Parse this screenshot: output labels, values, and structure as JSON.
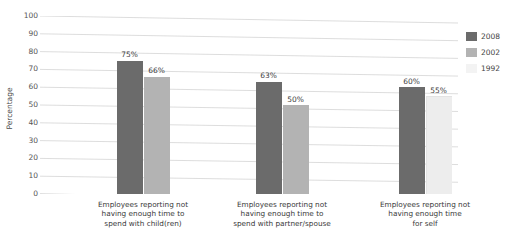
{
  "chart_data": {
    "type": "bar",
    "title": "",
    "xlabel": "",
    "ylabel": "Percentage",
    "ylim": [
      0,
      100
    ],
    "ytick_step": 10,
    "grid": true,
    "legend_position": "right",
    "categories": [
      "Employees reporting not having enough time to spend with child(ren)",
      "Employees reporting not having enough time to spend with partner/spouse",
      "Employees reporting not having enough time for self"
    ],
    "category_lines": [
      [
        "Employees reporting not",
        "having enough time to",
        "spend with child(ren)"
      ],
      [
        "Employees reporting not",
        "having enough time to",
        "spend with partner/spouse"
      ],
      [
        "Employees reporting not",
        "having enough time",
        "for self"
      ]
    ],
    "series": [
      {
        "name": "2008",
        "color": "#6b6b6b",
        "values": [
          75,
          63,
          60
        ]
      },
      {
        "name": "2002",
        "color": "#b3b3b3",
        "values": [
          66,
          50,
          null
        ]
      },
      {
        "name": "1992",
        "color": "#ededed",
        "values": [
          null,
          null,
          55
        ]
      }
    ],
    "yticks": [
      "100",
      "90",
      "80",
      "70",
      "60",
      "50",
      "40",
      "30",
      "20",
      "10",
      "0"
    ],
    "data_labels": [
      {
        "text": "75%",
        "group": 0,
        "series": "2008"
      },
      {
        "text": "66%",
        "group": 0,
        "series": "2002"
      },
      {
        "text": "63%",
        "group": 1,
        "series": "2008"
      },
      {
        "text": "50%",
        "group": 1,
        "series": "2002"
      },
      {
        "text": "60%",
        "group": 2,
        "series": "2008"
      },
      {
        "text": "55%",
        "group": 2,
        "series": "1992"
      }
    ]
  },
  "axis": {
    "y_title": "Percentage"
  },
  "legend": {
    "items": [
      {
        "label": "2008",
        "color": "#6b6b6b"
      },
      {
        "label": "2002",
        "color": "#b3b3b3"
      },
      {
        "label": "1992",
        "color": "#f3f3f3"
      }
    ]
  }
}
